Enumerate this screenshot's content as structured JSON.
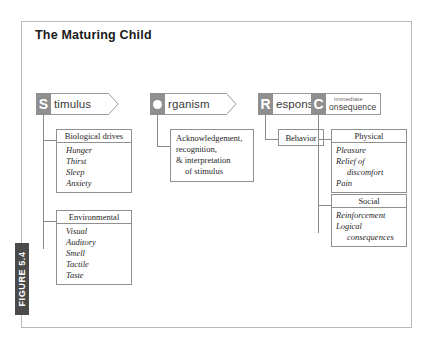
{
  "figure": {
    "label": "FIGURE 5.4",
    "title": "The Maturing Child"
  },
  "colors": {
    "frame_border": "#b9b9b9",
    "tab_background": "#4a4a4a",
    "tab_text": "#ffffff",
    "banner_cap": "#8f8f8f",
    "box_border": "#8f8f8f",
    "connector": "#8a8a8a",
    "text": "#1f1f1f"
  },
  "columns": [
    {
      "key": "stimulus",
      "banner": {
        "cap_letter": "S",
        "cap_icon": "letter-s",
        "word": "timulus",
        "full_label": "Stimulus"
      },
      "boxes": [
        {
          "heading": "Biological drives",
          "items": [
            "Hunger",
            "Thirst",
            "Sleep",
            "Anxiety"
          ]
        },
        {
          "heading": "Environmental",
          "items": [
            "Visual",
            "Auditory",
            "Smell",
            "Tactile",
            "Taste"
          ]
        }
      ]
    },
    {
      "key": "organism",
      "banner": {
        "cap_letter": "O",
        "cap_icon": "letter-o-dot",
        "word": "rganism",
        "full_label": "Organism"
      },
      "boxes": [
        {
          "heading": null,
          "lines": [
            "Acknowledgement,",
            "recognition,",
            "& interpretation",
            "of stimulus"
          ]
        }
      ]
    },
    {
      "key": "response",
      "banner": {
        "cap_letter": "R",
        "cap_icon": "letter-r",
        "word": "esponse",
        "full_label": "Response"
      },
      "boxes": [
        {
          "heading": null,
          "single": "Behavior"
        }
      ]
    },
    {
      "key": "consequence",
      "banner": {
        "cap_letter": "C",
        "cap_icon": "letter-c",
        "word_top": "immediate",
        "word_bottom": "onsequence",
        "full_label": "immediate Consequence"
      },
      "boxes": [
        {
          "heading": "Physical",
          "items": [
            "Pleasure",
            "Relief of",
            "discomfort",
            "Pain"
          ]
        },
        {
          "heading": "Social",
          "items": [
            "Reinforcement",
            "Logical",
            "consequences"
          ]
        }
      ]
    }
  ]
}
